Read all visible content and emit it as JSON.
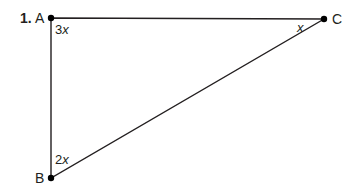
{
  "problem": {
    "number": "1.",
    "vertices": [
      {
        "name": "A",
        "x": 51,
        "y": 18
      },
      {
        "name": "C",
        "x": 324,
        "y": 19
      },
      {
        "name": "B",
        "x": 51,
        "y": 178
      }
    ],
    "angle_labels": {
      "A_coef": "3",
      "A_var": "x",
      "C_coef": "",
      "C_var": "x",
      "B_coef": "2",
      "B_var": "x"
    },
    "colors": {
      "line": "#231f20",
      "point": "#000000"
    }
  }
}
